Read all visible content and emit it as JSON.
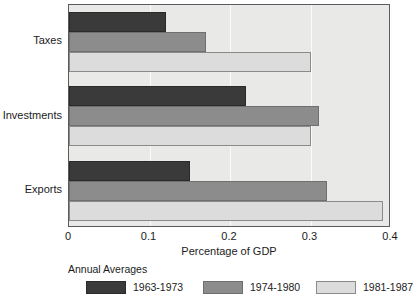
{
  "chart_data": {
    "type": "bar",
    "orientation": "horizontal",
    "title": "",
    "xlabel": "Percentage of GDP",
    "ylabel": "",
    "xlim": [
      0,
      0.4
    ],
    "xticks": [
      "0",
      "0.1",
      "0.2",
      "0.3",
      "0.4"
    ],
    "xtick_values": [
      0,
      0.1,
      0.2,
      0.3,
      0.4
    ],
    "grid": "vertical",
    "categories": [
      "Taxes",
      "Investments",
      "Exports"
    ],
    "legend_title": "Annual Averages",
    "legend_position": "below-left",
    "series": [
      {
        "name": "1963-1973",
        "color": "#3a3a3a",
        "values": [
          0.12,
          0.22,
          0.15
        ]
      },
      {
        "name": "1974-1980",
        "color": "#8c8c8c",
        "values": [
          0.17,
          0.31,
          0.32
        ]
      },
      {
        "name": "1981-1987",
        "color": "#dcdcdc",
        "values": [
          0.3,
          0.3,
          0.39
        ]
      }
    ],
    "plot_background": "#e9e9e7",
    "gridline_color": "#fbfbfb",
    "axis_color": "#5b5b5b"
  }
}
